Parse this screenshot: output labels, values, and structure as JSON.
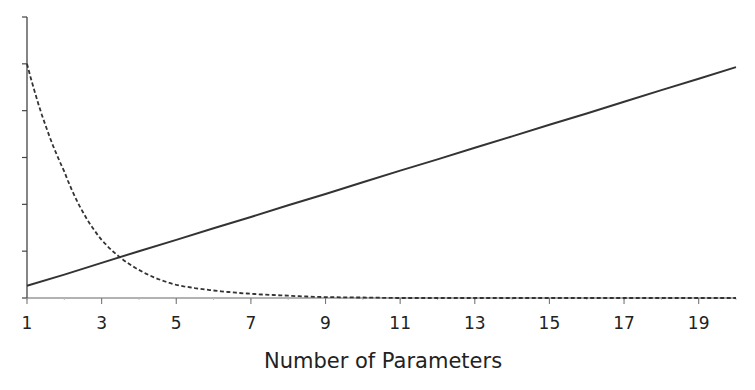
{
  "chart_data": {
    "type": "line",
    "title": "",
    "xlabel": "Number of Parameters",
    "ylabel": "",
    "x": [
      1,
      2,
      3,
      4,
      5,
      6,
      7,
      8,
      9,
      10,
      11,
      12,
      13,
      14,
      15,
      16,
      17,
      18,
      19,
      20
    ],
    "xlim": [
      1,
      20
    ],
    "ylim": [
      0,
      6
    ],
    "x_tick_labels": [
      "1",
      "3",
      "5",
      "7",
      "9",
      "11",
      "13",
      "15",
      "17",
      "19"
    ],
    "x_ticks": [
      1,
      3,
      5,
      7,
      9,
      11,
      13,
      15,
      17,
      19
    ],
    "y_ticks": [
      0,
      1,
      2,
      3,
      4,
      5,
      6
    ],
    "y_tick_labels": [],
    "grid": false,
    "legend": null,
    "series": [
      {
        "name": "solid-line",
        "style": "solid",
        "color": "#333333",
        "values": [
          0.26,
          0.5,
          0.75,
          1.0,
          1.24,
          1.49,
          1.73,
          1.98,
          2.22,
          2.47,
          2.72,
          2.96,
          3.21,
          3.45,
          3.7,
          3.94,
          4.19,
          4.44,
          4.68,
          4.93
        ]
      },
      {
        "name": "dashed-line",
        "style": "dashed",
        "color": "#333333",
        "values": [
          5.0,
          2.7,
          1.24,
          0.6,
          0.28,
          0.16,
          0.09,
          0.05,
          0.02,
          0.01,
          0.0,
          0.0,
          0.0,
          0.0,
          0.0,
          0.0,
          0.0,
          0.0,
          0.0,
          0.0
        ]
      }
    ]
  },
  "labels": {
    "x_axis_title": "Number of Parameters"
  }
}
